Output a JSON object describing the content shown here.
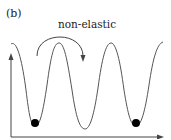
{
  "figure": {
    "panel_label": "(b)",
    "transition_label": "non-elastic",
    "colors": {
      "line": "#555555",
      "ball": "#000000",
      "background": "#ffffff"
    },
    "potential": {
      "description": "Triple-well periodic potential curve",
      "wells": 3,
      "occupied_wells": [
        1,
        3
      ]
    },
    "axes": {
      "x_arrow": true,
      "y_arrow": true
    }
  }
}
